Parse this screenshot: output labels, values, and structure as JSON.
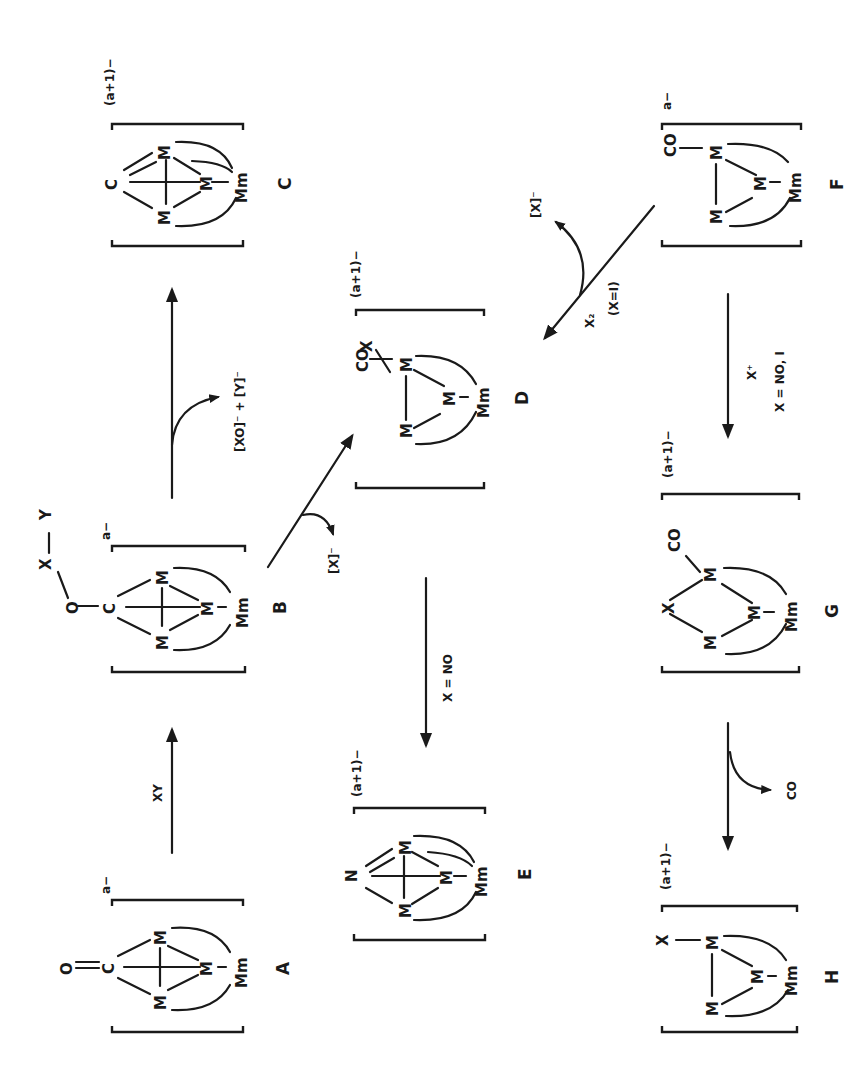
{
  "diagram": {
    "type": "reaction-scheme",
    "orientation": "rotated-90-ccw",
    "ink_color": "#1a1a1a",
    "background": "#ffffff",
    "compounds": [
      {
        "id": "A",
        "label": "A",
        "charge": "a−",
        "atoms": [
          "O",
          "C",
          "M",
          "M",
          "M",
          "Mm"
        ],
        "description": "O=C carbide-carbonyl on M3 face with Mm"
      },
      {
        "id": "B",
        "label": "B",
        "charge": "a−",
        "atoms": [
          "X",
          "Y",
          "O",
          "C",
          "M",
          "M",
          "M",
          "Mm"
        ],
        "description": "X—Y adduct O-bound to C"
      },
      {
        "id": "C",
        "label": "C",
        "charge": "(a+1)−",
        "atoms": [
          "C",
          "M",
          "M",
          "M",
          "Mm"
        ],
        "description": "carbide cluster"
      },
      {
        "id": "D",
        "label": "D",
        "charge": "(a+1)−",
        "atoms": [
          "CO",
          "X",
          "M",
          "M",
          "M",
          "Mm"
        ],
        "description": "M bearing CO and X"
      },
      {
        "id": "E",
        "label": "E",
        "charge": "(a+1)−",
        "atoms": [
          "N",
          "M",
          "M",
          "M",
          "Mm"
        ],
        "description": "nitride cluster"
      },
      {
        "id": "F",
        "label": "F",
        "charge": "a−",
        "atoms": [
          "CO",
          "M",
          "M",
          "M",
          "Mm"
        ],
        "description": "M3 triangle with terminal CO"
      },
      {
        "id": "G",
        "label": "G",
        "charge": "(a+1)−",
        "atoms": [
          "X",
          "CO",
          "M",
          "M",
          "M",
          "Mm"
        ],
        "description": "X bridging two M, CO terminal"
      },
      {
        "id": "H",
        "label": "H",
        "charge": "(a+1)−",
        "atoms": [
          "X",
          "M",
          "M",
          "M",
          "Mm"
        ],
        "description": "X terminal on M"
      }
    ],
    "reactions": [
      {
        "from": "A",
        "to": "B",
        "reagent": "XY",
        "byproduct": ""
      },
      {
        "from": "B",
        "to": "C",
        "reagent": "",
        "byproduct": "[XO]⁻ + [Y]⁻"
      },
      {
        "from": "B",
        "to": "D",
        "reagent": "",
        "byproduct": "[X]⁻"
      },
      {
        "from": "D",
        "to": "E",
        "reagent": "X = NO",
        "byproduct": ""
      },
      {
        "from": "F",
        "to": "D",
        "reagent": "X₂",
        "condition": "(X=I)",
        "byproduct": "[X]⁻"
      },
      {
        "from": "F",
        "to": "G",
        "reagent": "X⁺",
        "condition": "X = NO, I",
        "byproduct": ""
      },
      {
        "from": "G",
        "to": "H",
        "reagent": "",
        "byproduct": "CO"
      }
    ]
  },
  "labels": {
    "A": "A",
    "B": "B",
    "C": "C",
    "D": "D",
    "E": "E",
    "F": "F",
    "G": "G",
    "H": "H",
    "charge_a": "a−",
    "charge_a1": "(a+1)−",
    "M": "M",
    "Mm": "Mm",
    "C_atom": "C",
    "O_atom": "O",
    "N_atom": "N",
    "X_atom": "X",
    "Y_atom": "Y",
    "CO": "CO",
    "xy": "XY",
    "xo_y": "[XO]⁻ + [Y]⁻",
    "x_minus": "[X]⁻",
    "x_eq_no": "X = NO",
    "x2": "X₂",
    "x_eq_i": "(X=I)",
    "x_plus": "X⁺",
    "x_eq_no_i": "X = NO, I",
    "co_loss": "CO"
  }
}
